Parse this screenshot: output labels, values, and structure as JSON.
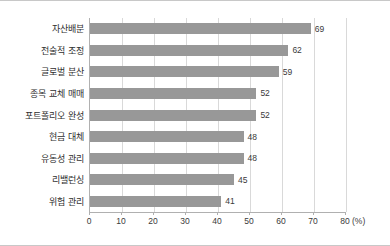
{
  "chart_data": {
    "type": "bar",
    "orientation": "horizontal",
    "title": "",
    "xlabel": "(%)",
    "ylabel": "",
    "unit": "(%)",
    "xlim": [
      0,
      80
    ],
    "xticks": [
      0,
      10,
      20,
      30,
      40,
      50,
      60,
      70,
      80
    ],
    "xtick_labels": [
      "0",
      "10",
      "20",
      "30",
      "40",
      "50",
      "60",
      "70",
      "80"
    ],
    "grid": true,
    "legend": false,
    "bar_color": "#989898",
    "categories": [
      "자산배분",
      "전술적 조정",
      "글로벌 분산",
      "종목 교체 매매",
      "포트폴리오 완성",
      "현금 대체",
      "유동성 관리",
      "리밸런싱",
      "위험 관리"
    ],
    "values": [
      69,
      62,
      59,
      52,
      52,
      48,
      48,
      45,
      41
    ],
    "value_labels": [
      "69",
      "62",
      "59",
      "52",
      "52",
      "48",
      "48",
      "45",
      "41"
    ]
  }
}
